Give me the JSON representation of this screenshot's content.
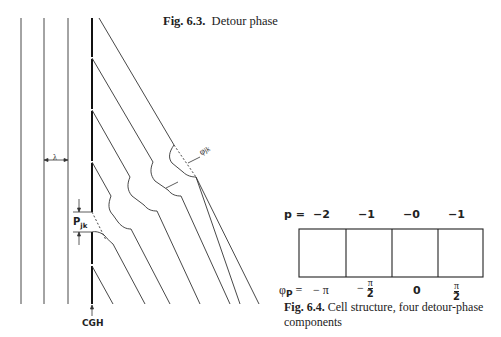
{
  "figure_6_3": {
    "caption_label": "Fig. 6.3.",
    "caption_text": "Detour phase",
    "labels": {
      "lambda": "λ",
      "p_jk": "P",
      "p_jk_sub": "jk",
      "phi_jk": "φ",
      "phi_jk_sub": "jk",
      "cgh": "CGH"
    }
  },
  "figure_6_4": {
    "caption_label": "Fig. 6.4.",
    "caption_text": "Cell structure, four detour-phase",
    "caption_text_line2": "components",
    "p_label": "p =",
    "p_values": [
      "−2",
      "−1",
      "−0",
      "−1"
    ],
    "phi_label": "φ",
    "phi_sub": "P",
    "phi_eq": "=",
    "phi_values": [
      {
        "sign": "−",
        "num": "π",
        "den": ""
      },
      {
        "sign": "−",
        "num": "π",
        "den": "2"
      },
      {
        "sign": "",
        "num": "0",
        "den": ""
      },
      {
        "sign": "",
        "num": "π",
        "den": "2"
      }
    ],
    "cells": 4
  }
}
